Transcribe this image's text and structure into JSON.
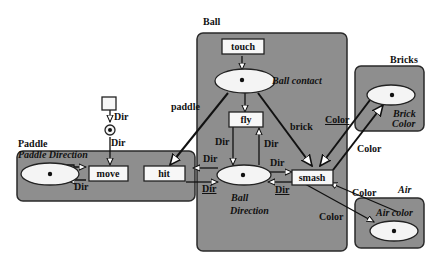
{
  "modules": {
    "ball": {
      "title": "Ball"
    },
    "paddle": {
      "title": "Paddle"
    },
    "bricks": {
      "title": "Bricks"
    },
    "air": {
      "title": "Air"
    }
  },
  "places": {
    "ball_contact": {
      "label": "Ball  contact",
      "token": true
    },
    "ball_direction": {
      "label_line1": "Ball",
      "label_line2": "Direction",
      "token": true
    },
    "paddle_direction": {
      "label": "Paddle  Direction",
      "token": true
    },
    "brick_color": {
      "label_line1": "Brick",
      "label_line2": "Color",
      "token": true
    },
    "air_color": {
      "label": "Air  color",
      "token": true
    },
    "input_place": {
      "label": "",
      "token": true
    }
  },
  "transitions": {
    "touch": "touch",
    "fly": "fly",
    "move": "move",
    "hit": "hit",
    "smash": "smash",
    "input": ""
  },
  "arc_labels": {
    "paddle": "paddle",
    "brick": "brick",
    "input_dir": "Dir",
    "move_in_dir": "Dir",
    "move_out_dir": "Dir",
    "hit_in_dir": "Dir",
    "hit_out_dir": "Dir",
    "fly_out_dir": "Dir",
    "fly_in_dir": "Dir",
    "smash_in_dir": "Dir",
    "smash_out_dir": "Dir",
    "color_brick_in": "Color",
    "color_brick_out": "Color",
    "color_air_out": "Color",
    "color_air_in": "Color"
  }
}
